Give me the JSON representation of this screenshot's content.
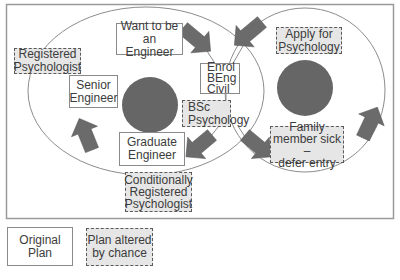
{
  "diagram": {
    "colors": {
      "arrow": "#6b6b6b",
      "dot": "#666666",
      "frame": "#9a9a9a",
      "cycle": "#8c8c8c",
      "chance_fill": "#e6e6e6"
    },
    "nodes": {
      "want_engineer": "Want to be an\nEngineer",
      "enrol_beng": "Enrol\nBEng\nCivil",
      "bsc_psychology": "BSc\nPsychology",
      "graduate_engineer": "Graduate\nEngineer",
      "senior_engineer": "Senior\nEngineer",
      "registered_psychologist": "Registered\nPsychologist",
      "conditionally_registered": "Conditionally\nRegistered\nPsychologist",
      "apply_psychology": "Apply for\nPsychology",
      "family_sick": "Family\nmember sick –\ndefer entry"
    },
    "legend": {
      "original_plan": "Original Plan",
      "altered_plan": "Plan altered\nby chance"
    }
  }
}
